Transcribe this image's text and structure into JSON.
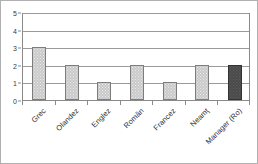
{
  "chart_data": {
    "type": "bar",
    "title": "",
    "xlabel": "",
    "ylabel": "",
    "categories": [
      "Grec",
      "Olandez",
      "Englez",
      "Român",
      "Francez",
      "Neamţ",
      "Manager (Ro)"
    ],
    "values": [
      3,
      2,
      1,
      2,
      1,
      2,
      2
    ],
    "ylim": [
      0,
      5
    ],
    "yticks": [
      "0",
      "1",
      "2",
      "3",
      "4",
      "5"
    ],
    "grid": true,
    "legend": "none",
    "bar_colors": [
      "#c9c9c9",
      "#c9c9c9",
      "#c9c9c9",
      "#c9c9c9",
      "#c9c9c9",
      "#c9c9c9",
      "#4a4a4a"
    ],
    "series": [
      {
        "name": "",
        "values": [
          3,
          2,
          1,
          2,
          1,
          2,
          2
        ]
      }
    ]
  },
  "style": {
    "plot_border": "#8a8a8a",
    "gridline": "#9a9a9a",
    "frame_border": "#b0b0b0",
    "background": "#ffffff",
    "tick_text": "#2e2e2e"
  }
}
